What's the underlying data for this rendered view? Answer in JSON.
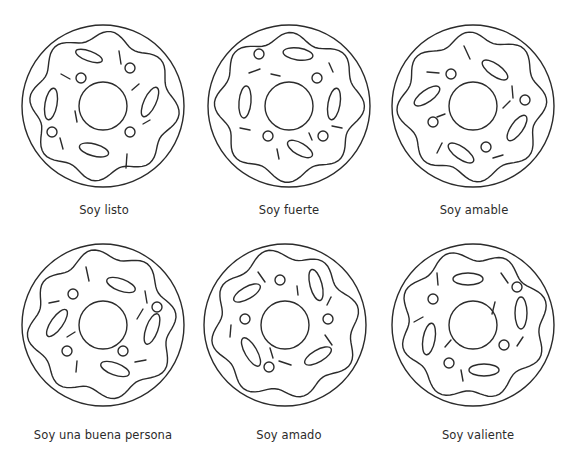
{
  "page": {
    "background": "#ffffff",
    "stroke_color": "#2b2b2b"
  },
  "donuts": [
    {
      "label": "Soy listo",
      "center": [
        103,
        106
      ],
      "label_pos": [
        104,
        205
      ],
      "seed": 1,
      "ovals": [
        [
          -14,
          -50,
          14,
          5,
          20
        ],
        [
          -52,
          -2,
          6,
          16,
          10
        ],
        [
          47,
          -4,
          6,
          16,
          25
        ],
        [
          -9,
          44,
          15,
          6,
          15
        ]
      ],
      "dots": [
        [
          -22,
          -28,
          5
        ],
        [
          27,
          -38,
          5
        ],
        [
          -51,
          26,
          5
        ],
        [
          27,
          26,
          5
        ]
      ],
      "sprinkles": [
        [
          16,
          -55,
          18,
          -42
        ],
        [
          -42,
          -32,
          -33,
          -27
        ],
        [
          29,
          -16,
          36,
          -22
        ],
        [
          -28,
          5,
          -26,
          16
        ],
        [
          40,
          18,
          47,
          14
        ],
        [
          -43,
          32,
          -40,
          43
        ],
        [
          24,
          48,
          23,
          62
        ]
      ]
    },
    {
      "label": "Soy fuerte",
      "center": [
        289,
        106
      ],
      "label_pos": [
        289,
        205
      ],
      "seed": 2,
      "ovals": [
        [
          9,
          -52,
          15,
          6,
          8
        ],
        [
          -44,
          -4,
          6,
          16,
          5
        ],
        [
          45,
          -2,
          6,
          16,
          10
        ],
        [
          11,
          43,
          14,
          6,
          30
        ]
      ],
      "dots": [
        [
          -30,
          -52,
          5
        ],
        [
          28,
          -28,
          5
        ],
        [
          -21,
          30,
          5
        ],
        [
          34,
          30,
          5
        ]
      ],
      "sprinkles": [
        [
          -40,
          -33,
          -29,
          -37
        ],
        [
          -18,
          -32,
          -9,
          -30
        ],
        [
          40,
          -43,
          44,
          -34
        ],
        [
          -49,
          22,
          -39,
          24
        ],
        [
          43,
          20,
          53,
          22
        ],
        [
          20,
          27,
          23,
          34
        ],
        [
          -12,
          43,
          -10,
          53
        ]
      ]
    },
    {
      "label": "Soy amable",
      "center": [
        473,
        106
      ],
      "label_pos": [
        474,
        205
      ],
      "seed": 3,
      "ovals": [
        [
          22,
          -36,
          15,
          6,
          35
        ],
        [
          -46,
          -10,
          15,
          6,
          -35
        ],
        [
          44,
          22,
          15,
          6,
          -55
        ],
        [
          -12,
          47,
          15,
          6,
          35
        ]
      ],
      "dots": [
        [
          -22,
          -32,
          5
        ],
        [
          52,
          -6,
          5
        ],
        [
          -40,
          16,
          5
        ],
        [
          13,
          41,
          5
        ]
      ],
      "sprinkles": [
        [
          -9,
          -60,
          -3,
          -47
        ],
        [
          -46,
          -34,
          -34,
          -33
        ],
        [
          39,
          -20,
          40,
          -8
        ],
        [
          -36,
          11,
          -28,
          8
        ],
        [
          30,
          2,
          37,
          -5
        ],
        [
          -36,
          47,
          -31,
          37
        ],
        [
          20,
          52,
          30,
          49
        ]
      ]
    },
    {
      "label": "Soy una buena persona",
      "center": [
        103,
        325
      ],
      "label_pos": [
        103,
        430
      ],
      "seed": 4,
      "ovals": [
        [
          18,
          -40,
          15,
          6,
          20
        ],
        [
          -46,
          -2,
          16,
          6,
          -55
        ],
        [
          49,
          4,
          6,
          16,
          20
        ],
        [
          12,
          44,
          15,
          6,
          20
        ]
      ],
      "dots": [
        [
          -30,
          -31,
          5
        ],
        [
          54,
          -18,
          5
        ],
        [
          -36,
          26,
          5
        ],
        [
          20,
          26,
          5
        ]
      ],
      "sprinkles": [
        [
          -17,
          -58,
          -14,
          -44
        ],
        [
          -54,
          -22,
          -44,
          -24
        ],
        [
          42,
          -34,
          44,
          -22
        ],
        [
          -36,
          12,
          -28,
          7
        ],
        [
          34,
          -6,
          40,
          -16
        ],
        [
          -26,
          36,
          -27,
          47
        ],
        [
          32,
          37,
          43,
          35
        ]
      ]
    },
    {
      "label": "Soy amado",
      "center": [
        285,
        325
      ],
      "label_pos": [
        289,
        430
      ],
      "seed": 5,
      "ovals": [
        [
          -38,
          -32,
          15,
          6,
          -30
        ],
        [
          31,
          -40,
          6,
          16,
          -15
        ],
        [
          -34,
          27,
          6,
          16,
          -30
        ],
        [
          33,
          31,
          15,
          6,
          -30
        ],
        [
          29,
          29,
          0,
          0,
          0
        ]
      ],
      "dots": [
        [
          -5,
          -45,
          5
        ],
        [
          -40,
          -6,
          5
        ],
        [
          43,
          -6,
          5
        ],
        [
          -16,
          42,
          5
        ]
      ],
      "sprinkles": [
        [
          -27,
          -53,
          -20,
          -43
        ],
        [
          12,
          -39,
          13,
          -30
        ],
        [
          46,
          -28,
          42,
          -20
        ],
        [
          -54,
          0,
          -55,
          12
        ],
        [
          40,
          10,
          47,
          20
        ],
        [
          -15,
          23,
          -12,
          33
        ],
        [
          -6,
          36,
          6,
          40
        ]
      ]
    },
    {
      "label": "Soy valiente",
      "center": [
        473,
        325
      ],
      "label_pos": [
        478,
        430
      ],
      "seed": 6,
      "ovals": [
        [
          -5,
          -46,
          15,
          6,
          0
        ],
        [
          48,
          -12,
          6,
          16,
          0
        ],
        [
          -44,
          14,
          6,
          16,
          10
        ],
        [
          11,
          45,
          15,
          6,
          0
        ]
      ],
      "dots": [
        [
          -40,
          -26,
          5
        ],
        [
          44,
          -38,
          5
        ],
        [
          31,
          20,
          5
        ],
        [
          -24,
          38,
          5
        ]
      ],
      "sprinkles": [
        [
          -36,
          -52,
          -35,
          -40
        ],
        [
          28,
          -52,
          35,
          -42
        ],
        [
          -59,
          -3,
          -50,
          -8
        ],
        [
          22,
          -23,
          19,
          -11
        ],
        [
          -28,
          22,
          -22,
          15
        ],
        [
          50,
          12,
          44,
          21
        ],
        [
          -12,
          45,
          -10,
          56
        ]
      ]
    }
  ],
  "geometry": {
    "outer_radius": 81,
    "icing_radius": 70,
    "icing_wave": 5,
    "icing_lobes": 8,
    "hole_radius": 24
  }
}
